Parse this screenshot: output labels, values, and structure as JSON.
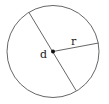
{
  "diagram": {
    "labels": {
      "diameter": "d",
      "radius": "r"
    },
    "colors": {
      "stroke": "#555555",
      "dot": "#111111",
      "text": "#222222",
      "background": "#ffffff"
    }
  }
}
